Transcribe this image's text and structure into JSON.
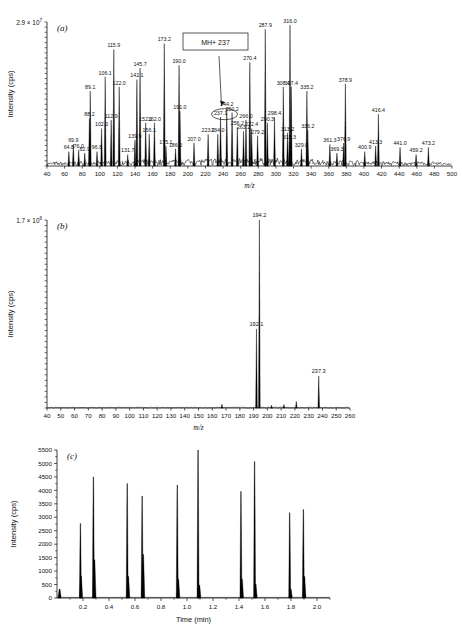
{
  "figure": {
    "panel_labels": {
      "a": "(a)",
      "b": "(b)",
      "c": "(c)"
    },
    "axis_titles": {
      "mz": "m/z",
      "time": "Time (min)",
      "intensity": "Intensity (cps)"
    }
  },
  "chart_data": [
    {
      "type": "line",
      "panel": "a",
      "title": "(a)",
      "xlabel": "m/z",
      "ylabel": "Intensity (cps)",
      "y_scale_label": "2.9 × 10",
      "y_scale_exponent": "7",
      "xlim": [
        40,
        500
      ],
      "ylim": [
        0,
        29000000
      ],
      "xticks": [
        40,
        60,
        80,
        100,
        120,
        140,
        160,
        180,
        200,
        220,
        240,
        260,
        280,
        300,
        320,
        340,
        360,
        380,
        400,
        420,
        440,
        460,
        480,
        500
      ],
      "grid": false,
      "annotation": {
        "text": "MH+ 237",
        "points_to_mz": 237.1
      },
      "peaks": [
        {
          "mz": 64.8,
          "label": "64.8",
          "rel": 0.1
        },
        {
          "mz": 69.9,
          "label": "69.9",
          "rel": 0.15
        },
        {
          "mz": 76.0,
          "label": "76.0",
          "rel": 0.11
        },
        {
          "mz": 82.9,
          "label": "82.9",
          "rel": 0.09
        },
        {
          "mz": 88.2,
          "label": "88.2",
          "rel": 0.33
        },
        {
          "mz": 89.1,
          "label": "89.1",
          "rel": 0.52
        },
        {
          "mz": 96.8,
          "label": "96.8",
          "rel": 0.1
        },
        {
          "mz": 102.0,
          "label": "102.0",
          "rel": 0.26
        },
        {
          "mz": 106.1,
          "label": "106.1",
          "rel": 0.62
        },
        {
          "mz": 112.9,
          "label": "112.9",
          "rel": 0.32
        },
        {
          "mz": 115.9,
          "label": "115.9",
          "rel": 0.81
        },
        {
          "mz": 122.0,
          "label": "122.0",
          "rel": 0.55
        },
        {
          "mz": 131.7,
          "label": "131.7",
          "rel": 0.08
        },
        {
          "mz": 139.9,
          "label": "139.9",
          "rel": 0.18
        },
        {
          "mz": 142.1,
          "label": "142.1",
          "rel": 0.6
        },
        {
          "mz": 145.7,
          "label": "145.7",
          "rel": 0.68
        },
        {
          "mz": 152.1,
          "label": "152.1",
          "rel": 0.3
        },
        {
          "mz": 156.1,
          "label": "156.1",
          "rel": 0.22
        },
        {
          "mz": 162.0,
          "label": "162.0",
          "rel": 0.3
        },
        {
          "mz": 173.2,
          "label": "173.2",
          "rel": 0.85
        },
        {
          "mz": 175.1,
          "label": "175.1",
          "rel": 0.14
        },
        {
          "mz": 186.0,
          "label": "186.0",
          "rel": 0.12
        },
        {
          "mz": 190.0,
          "label": "190.0",
          "rel": 0.7
        },
        {
          "mz": 191.0,
          "label": "191.0",
          "rel": 0.38
        },
        {
          "mz": 207.0,
          "label": "207.0",
          "rel": 0.16
        },
        {
          "mz": 223.0,
          "label": "223.0",
          "rel": 0.22
        },
        {
          "mz": 234.0,
          "label": "234.0",
          "rel": 0.22
        },
        {
          "mz": 237.1,
          "label": "237.1",
          "rel": 0.34
        },
        {
          "mz": 244.2,
          "label": "244.2",
          "rel": 0.4
        },
        {
          "mz": 250.2,
          "label": "250.2",
          "rel": 0.37
        },
        {
          "mz": 256.2,
          "label": "256.2",
          "rel": 0.27
        },
        {
          "mz": 263.2,
          "label": "263.2",
          "rel": 0.24
        },
        {
          "mz": 266.0,
          "label": "266.0",
          "rel": 0.32
        },
        {
          "mz": 270.4,
          "label": "270.4",
          "rel": 0.72
        },
        {
          "mz": 272.4,
          "label": "272.4",
          "rel": 0.26
        },
        {
          "mz": 279.2,
          "label": "279.2",
          "rel": 0.21
        },
        {
          "mz": 287.9,
          "label": "287.9",
          "rel": 0.95
        },
        {
          "mz": 290.3,
          "label": "290.3",
          "rel": 0.3
        },
        {
          "mz": 298.4,
          "label": "298.4",
          "rel": 0.34
        },
        {
          "mz": 308.4,
          "label": "308.4",
          "rel": 0.55
        },
        {
          "mz": 313.2,
          "label": "313.2",
          "rel": 0.23
        },
        {
          "mz": 315.3,
          "label": "315.3",
          "rel": 0.17
        },
        {
          "mz": 316.0,
          "label": "316.0",
          "rel": 0.98
        },
        {
          "mz": 317.4,
          "label": "317.4",
          "rel": 0.55
        },
        {
          "mz": 329.0,
          "label": "329.0",
          "rel": 0.12
        },
        {
          "mz": 335.2,
          "label": "335.2",
          "rel": 0.52
        },
        {
          "mz": 336.2,
          "label": "336.2",
          "rel": 0.25
        },
        {
          "mz": 361.3,
          "label": "361.3",
          "rel": 0.15
        },
        {
          "mz": 369.3,
          "label": "369.3",
          "rel": 0.09
        },
        {
          "mz": 376.9,
          "label": "376.9",
          "rel": 0.16
        },
        {
          "mz": 378.9,
          "label": "378.9",
          "rel": 0.57
        },
        {
          "mz": 400.9,
          "label": "400.9",
          "rel": 0.1
        },
        {
          "mz": 413.3,
          "label": "413.3",
          "rel": 0.14
        },
        {
          "mz": 416.4,
          "label": "416.4",
          "rel": 0.36
        },
        {
          "mz": 441.0,
          "label": "441.0",
          "rel": 0.13
        },
        {
          "mz": 459.2,
          "label": "459.2",
          "rel": 0.08
        },
        {
          "mz": 473.2,
          "label": "473.2",
          "rel": 0.13
        }
      ]
    },
    {
      "type": "line",
      "panel": "b",
      "title": "(b)",
      "xlabel": "m/z",
      "ylabel": "Intensity (cps)",
      "y_scale_label": "1.7 × 10",
      "y_scale_exponent": "6",
      "xlim": [
        40,
        260
      ],
      "ylim": [
        0,
        1700000
      ],
      "xticks": [
        40,
        50,
        60,
        70,
        80,
        90,
        100,
        110,
        120,
        130,
        140,
        150,
        160,
        170,
        180,
        190,
        200,
        210,
        220,
        230,
        240,
        250,
        260
      ],
      "grid": false,
      "peaks": [
        {
          "mz": 194.2,
          "label": "194.2",
          "rel": 1.0
        },
        {
          "mz": 192.1,
          "label": "192.1",
          "rel": 0.42
        },
        {
          "mz": 237.3,
          "label": "237.3",
          "rel": 0.17
        },
        {
          "mz": 167.0,
          "label": "",
          "rel": 0.02
        },
        {
          "mz": 203.0,
          "label": "",
          "rel": 0.015
        },
        {
          "mz": 212.0,
          "label": "",
          "rel": 0.018
        },
        {
          "mz": 221.0,
          "label": "",
          "rel": 0.035
        }
      ]
    },
    {
      "type": "line",
      "panel": "c",
      "title": "(c)",
      "xlabel": "Time (min)",
      "ylabel": "Intensity (cps)",
      "xlim": [
        0.0,
        2.1
      ],
      "ylim": [
        0,
        5500
      ],
      "xticks": [
        0.2,
        0.4,
        0.6,
        0.8,
        1.0,
        1.2,
        1.4,
        1.6,
        1.8,
        2.0
      ],
      "yticks": [
        0,
        500,
        1000,
        1500,
        2000,
        2500,
        3000,
        3500,
        4000,
        4500,
        5000,
        5500
      ],
      "grid": false,
      "peaks": [
        {
          "time": 0.02,
          "height": 330
        },
        {
          "time": 0.18,
          "height": 2770
        },
        {
          "time": 0.185,
          "height": 820
        },
        {
          "time": 0.28,
          "height": 4500
        },
        {
          "time": 0.288,
          "height": 1420
        },
        {
          "time": 0.54,
          "height": 4250
        },
        {
          "time": 0.548,
          "height": 800
        },
        {
          "time": 0.655,
          "height": 3790
        },
        {
          "time": 0.663,
          "height": 1620
        },
        {
          "time": 0.925,
          "height": 4200
        },
        {
          "time": 0.933,
          "height": 700
        },
        {
          "time": 1.085,
          "height": 5500
        },
        {
          "time": 1.095,
          "height": 480
        },
        {
          "time": 1.415,
          "height": 3960
        },
        {
          "time": 1.423,
          "height": 700
        },
        {
          "time": 1.52,
          "height": 5070
        },
        {
          "time": 1.528,
          "height": 520
        },
        {
          "time": 1.79,
          "height": 3170
        },
        {
          "time": 1.798,
          "height": 330
        },
        {
          "time": 1.895,
          "height": 3290
        },
        {
          "time": 1.903,
          "height": 800
        }
      ]
    }
  ]
}
